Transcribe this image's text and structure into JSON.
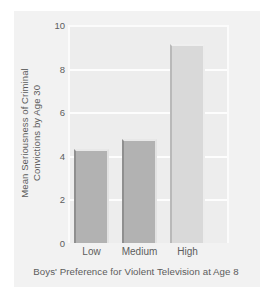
{
  "chart_data": {
    "type": "bar",
    "title": "",
    "subtitle": "",
    "xlabel": "Boys' Preference for Violent Television at Age 8",
    "ylabel_line1": "Mean Seriousness of Criminal",
    "ylabel_line2": "Convictions by Age 30",
    "categories": [
      "Low",
      "Medium",
      "High"
    ],
    "values": [
      4.3,
      4.75,
      9.15
    ],
    "series": [
      {
        "name": "Mean Seriousness of Criminal Convictions by Age 30",
        "values": [
          4.3,
          4.75,
          9.15
        ]
      }
    ],
    "ylim": [
      0,
      10
    ],
    "yticks": [
      0,
      2,
      4,
      6,
      8,
      10
    ],
    "ytick_labels": [
      "0",
      "2",
      "4",
      "6",
      "8",
      "10"
    ],
    "xtick_labels": [
      "Low",
      "Medium",
      "High"
    ],
    "grid": true,
    "grid_axis": "y",
    "legend": false,
    "legend_position": "none",
    "bar_colors": [
      "#b2b2b2",
      "#b2b2b2",
      "#d9d9d9"
    ],
    "plot_background": "#ededed",
    "figure_background": "#f2f2f2",
    "text_color": "#5c5c5c",
    "gridline_color": "#fdfdfd",
    "annotations": []
  }
}
